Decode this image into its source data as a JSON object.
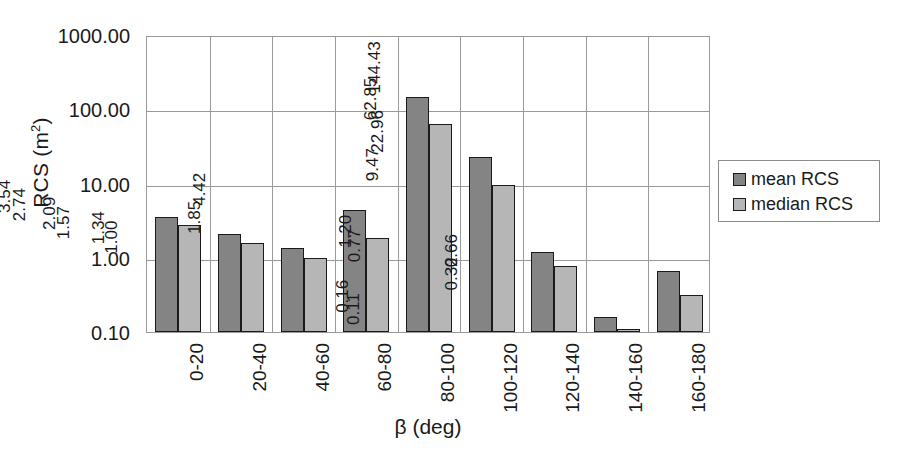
{
  "chart_data": {
    "type": "bar",
    "title": "",
    "xlabel": "β (deg)",
    "ylabel": "RCS (m²)",
    "ylabel_base": "RCS (m",
    "ylabel_sup": "2",
    "ylabel_close": ")",
    "yscale": "log",
    "ylim": [
      0.1,
      1000.0
    ],
    "ytick_labels": [
      "1000.00",
      "100.00",
      "10.00",
      "1.00",
      "0.10"
    ],
    "ytick_values": [
      1000.0,
      100.0,
      10.0,
      1.0,
      0.1
    ],
    "grid": "horizontal-and-vertical",
    "legend_position": "right",
    "categories": [
      "0-20",
      "20-40",
      "40-60",
      "60-80",
      "80-100",
      "100-120",
      "120-140",
      "140-160",
      "160-180"
    ],
    "series": [
      {
        "name": "mean RCS",
        "color": "#848484",
        "values": [
          3.54,
          2.09,
          1.34,
          4.42,
          144.43,
          22.96,
          1.2,
          0.16,
          0.66
        ],
        "labels": [
          "3.54",
          "2.09",
          "1.34",
          "4.42",
          "144.43",
          "22.96",
          "1.20",
          "0.16",
          "0.66"
        ]
      },
      {
        "name": "median RCS",
        "color": "#b6b6b6",
        "values": [
          2.74,
          1.57,
          1.0,
          1.85,
          62.85,
          9.47,
          0.77,
          0.11,
          0.32
        ],
        "labels": [
          "2.74",
          "1.57",
          "1.00",
          "1.85",
          "62.85",
          "9.47",
          "0.77",
          "0.11",
          "0.32"
        ]
      }
    ]
  },
  "legend": {
    "items": [
      {
        "label": "mean RCS",
        "swatch": "mean"
      },
      {
        "label": "median RCS",
        "swatch": "median"
      }
    ]
  }
}
